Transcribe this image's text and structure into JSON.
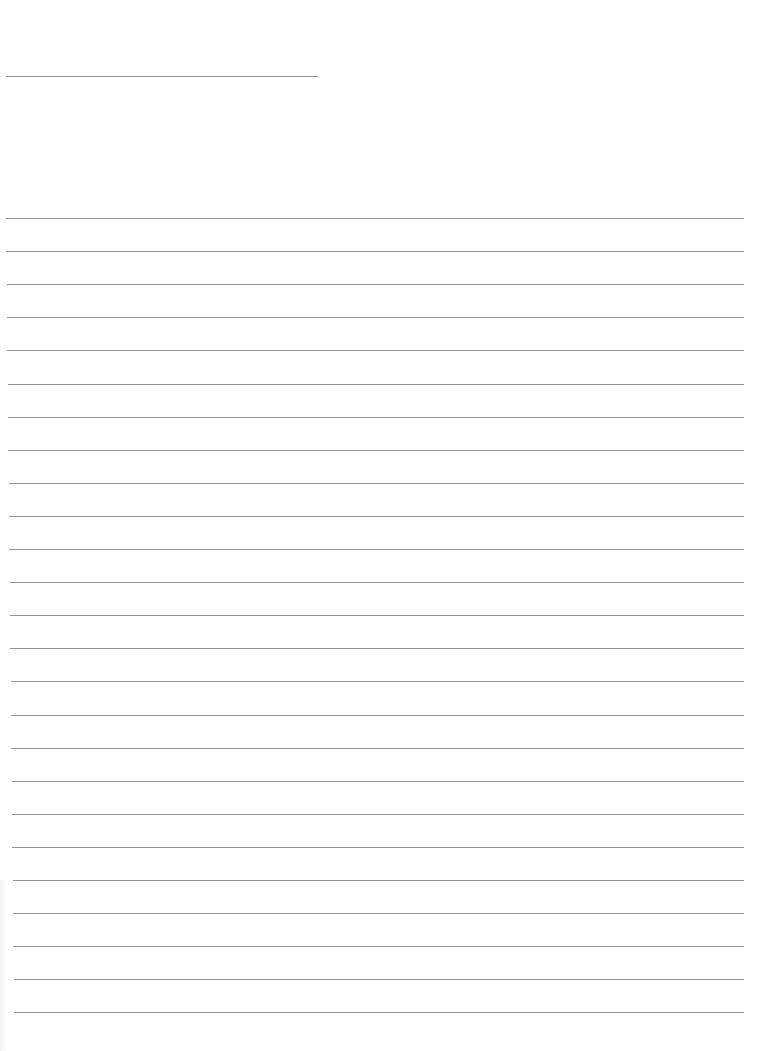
{
  "page": {
    "type": "lined-paper",
    "background_color": "#ffffff",
    "line_color": "#8a8a8a"
  },
  "header_line": {
    "y": 76,
    "x_start": 6,
    "x_end": 318
  },
  "ruled_lines": {
    "count": 25,
    "first_y": 218,
    "spacing": 33.1,
    "x_start_top": 6,
    "x_start_bottom": 14,
    "x_end": 744
  }
}
